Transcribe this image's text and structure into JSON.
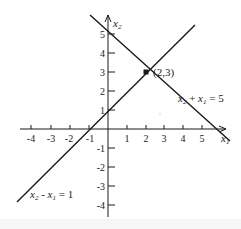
{
  "diagram": {
    "type": "linear-equations-graph",
    "axes": {
      "x_label": "x",
      "x_label_sub": "1",
      "y_label": "x",
      "y_label_sub": "2",
      "x_ticks": [
        "-4",
        "-3",
        "-2",
        "-1",
        "1",
        "2",
        "3",
        "4",
        "5"
      ],
      "y_ticks": [
        "5",
        "4",
        "3",
        "2",
        "1",
        "-1",
        "-2",
        "-3",
        "-4"
      ]
    },
    "lines": [
      {
        "name": "x2-plus-x1",
        "label_a": "x",
        "sub_a": "2",
        "op": " + ",
        "label_b": "x",
        "sub_b": "1",
        "rhs": " = 5"
      },
      {
        "name": "x2-minus-x1",
        "label_a": "x",
        "sub_a": "2",
        "op": " - ",
        "label_b": "x",
        "sub_b": "1",
        "rhs": " = 1"
      }
    ],
    "intersection": {
      "label": "(2,3)",
      "x": 2,
      "y": 3
    },
    "colors": {
      "ink": "#1a1a1a",
      "background": "#ffffff"
    }
  }
}
